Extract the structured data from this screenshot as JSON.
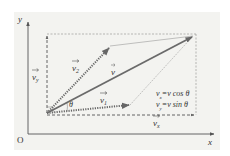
{
  "diagram": {
    "axes": {
      "x_label": "x",
      "y_label": "y",
      "origin_label": "O"
    },
    "vectors": {
      "v": {
        "label": "v",
        "style": "solid",
        "color": "#6a6a6a"
      },
      "v1": {
        "label": "v",
        "sub": "1",
        "style": "dotted"
      },
      "v2": {
        "label": "v",
        "sub": "2",
        "style": "dotted"
      },
      "vx": {
        "label": "v",
        "sub": "x",
        "style": "dashed"
      },
      "vy": {
        "label": "v",
        "sub": "y",
        "style": "dashed"
      }
    },
    "angle_label": "θ",
    "equations": [
      {
        "lhs": "v",
        "sub": "x",
        "rhs": "=v cos θ"
      },
      {
        "lhs": "v",
        "sub": "y",
        "rhs": "=v sin θ"
      }
    ],
    "colors": {
      "background": "#f3f3f0",
      "ink": "#555555"
    }
  }
}
